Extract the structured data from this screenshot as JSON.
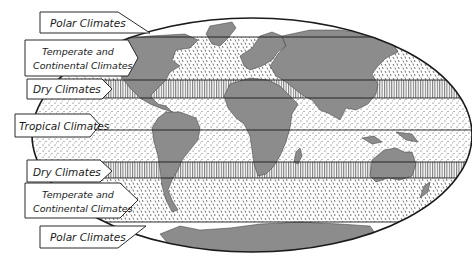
{
  "map": {
    "type": "world climate zones",
    "colors": {
      "land": "#8c8c8c",
      "ocean": "#ffffff",
      "outline": "#1a1a1a",
      "hatch": "#3a3a3a"
    },
    "zones": [
      {
        "id": "polar-north",
        "label": "Polar Climates",
        "pattern": "plain"
      },
      {
        "id": "temperate-north",
        "label_line1": "Temperate and",
        "label_line2": "Continental Climates",
        "pattern": "dashes"
      },
      {
        "id": "dry-north",
        "label": "Dry Climates",
        "pattern": "vertical-hatch"
      },
      {
        "id": "tropical",
        "label": "Tropical Climates",
        "pattern": "dots"
      },
      {
        "id": "dry-south",
        "label": "Dry Climates",
        "pattern": "vertical-hatch"
      },
      {
        "id": "temperate-south",
        "label_line1": "Temperate and",
        "label_line2": "Continental Climates",
        "pattern": "dashes"
      },
      {
        "id": "polar-south",
        "label": "Polar Climates",
        "pattern": "plain"
      }
    ]
  }
}
